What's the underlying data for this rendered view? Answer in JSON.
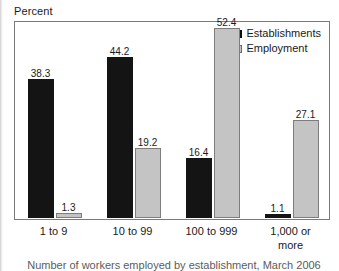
{
  "chart_data": {
    "type": "bar",
    "title": "",
    "ylabel": "Percent",
    "xlabel": "Number of workers employed by establishment, March 2006",
    "categories": [
      "1 to 9",
      "10 to 99",
      "100 to 999",
      "1,000 or\nmore"
    ],
    "series": [
      {
        "name": "Establishments",
        "color": "#141414",
        "values": [
          38.3,
          44.2,
          16.4,
          1.1
        ],
        "labels": [
          "38.3",
          "44.2",
          "16.4",
          "1.1"
        ]
      },
      {
        "name": "Employment",
        "color": "#c4c4c4",
        "values": [
          1.3,
          19.2,
          52.4,
          27.1
        ],
        "labels": [
          "1.3",
          "19.2",
          "52.4",
          "27.1"
        ]
      }
    ],
    "ylim": [
      0,
      60
    ],
    "grid": false,
    "legend_position": "top-right"
  },
  "axis": {
    "y_title": "Percent",
    "x_caption": "Number of workers employed by establishment, March 2006"
  },
  "legend": {
    "items": [
      {
        "label": "Establishments"
      },
      {
        "label": "Employment"
      }
    ]
  }
}
